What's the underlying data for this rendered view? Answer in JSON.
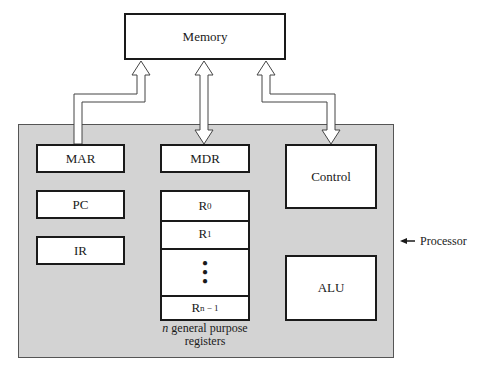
{
  "diagram": {
    "type": "computer-organization-block-diagram",
    "memory": {
      "label": "Memory"
    },
    "processor": {
      "label": "Processor",
      "pointer_arrow": "left-arrow",
      "components": {
        "mar": {
          "label": "MAR"
        },
        "mdr": {
          "label": "MDR"
        },
        "control": {
          "label": "Control"
        },
        "pc": {
          "label": "PC"
        },
        "ir": {
          "label": "IR"
        },
        "alu": {
          "label": "ALU"
        }
      },
      "register_file": {
        "registers": [
          {
            "base": "R",
            "sub": "0"
          },
          {
            "base": "R",
            "sub": "1"
          },
          {
            "ellipsis": "⋮"
          },
          {
            "base": "R",
            "sub": "n − 1"
          }
        ],
        "caption_italic": "n",
        "caption_rest": " general purpose",
        "caption_line2": "registers"
      }
    },
    "connections": [
      {
        "from": "MAR",
        "to": "Memory",
        "direction": "to-memory"
      },
      {
        "from": "MDR",
        "to": "Memory",
        "direction": "bidirectional"
      },
      {
        "from": "Control",
        "to": "Memory",
        "direction": "bidirectional"
      }
    ],
    "colors": {
      "processor_fill": "#d3d3d3",
      "box_fill": "#ffffff",
      "stroke": "#1a1a1a"
    }
  }
}
